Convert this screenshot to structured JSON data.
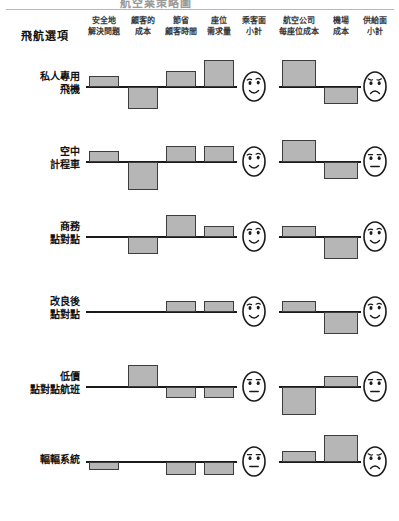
{
  "figure": {
    "clipped_title": "航空業策略圖",
    "row_header_label": "飛航選項"
  },
  "chart_data": {
    "type": "bar",
    "xlabel": "",
    "ylabel": "",
    "grid": false,
    "legend": "none",
    "note": "Six flight options rated on eight factors; positive bars point up, negative bars point down from each row baseline. Subtotal columns are rendered as face icons (happy / neutral / sad).",
    "categories": [
      "安全地解決問題",
      "顧客的成本",
      "節省顧客時間",
      "座位需求量",
      "乘客面小計",
      "航空公司每座位成本",
      "機場成本",
      "供給面小計"
    ],
    "category_headers": [
      {
        "line1": "安全地",
        "line2": "解決問題"
      },
      {
        "line1": "顧客的",
        "line2": "成本"
      },
      {
        "line1": "節省",
        "line2": "顧客時間"
      },
      {
        "line1": "座位",
        "line2": "需求量"
      },
      {
        "line1": "乘客面",
        "line2": "小計"
      },
      {
        "line1": "航空公司",
        "line2": "每座位成本"
      },
      {
        "line1": "機場",
        "line2": "成本"
      },
      {
        "line1": "供給面",
        "line2": "小計"
      }
    ],
    "subtotal_columns": [
      4,
      7
    ],
    "face_values": {
      "happy": "happy",
      "neutral": "neutral",
      "sad": "sad"
    },
    "series": [
      {
        "name": "私人專用飛機",
        "label_line1": "私人專用",
        "label_line2": "飛機",
        "values": [
          1,
          -2,
          1.5,
          2.5,
          null,
          2.5,
          -1.5,
          null
        ],
        "faces": {
          "passenger": "happy",
          "supply": "sad"
        }
      },
      {
        "name": "空中計程車",
        "label_line1": "空中",
        "label_line2": "計程車",
        "values": [
          1,
          -2.5,
          1.5,
          1.5,
          null,
          2,
          -1.5,
          null
        ],
        "faces": {
          "passenger": "happy",
          "supply": "neutral"
        }
      },
      {
        "name": "商務點對點",
        "label_line1": "商務",
        "label_line2": "點對點",
        "values": [
          0,
          -1.5,
          2,
          1,
          null,
          1,
          -2,
          null
        ],
        "faces": {
          "passenger": "happy",
          "supply": "happy"
        }
      },
      {
        "name": "改良後點對點",
        "label_line1": "改良後",
        "label_line2": "點對點",
        "values": [
          0,
          0,
          1,
          1,
          null,
          1,
          -2,
          null
        ],
        "faces": {
          "passenger": "happy",
          "supply": "happy"
        }
      },
      {
        "name": "低價點對點航班",
        "label_line1": "低價",
        "label_line2": "點對點航班",
        "values": [
          0,
          2,
          -1,
          -1,
          null,
          -2.5,
          1,
          null
        ],
        "faces": {
          "passenger": "neutral",
          "supply": "neutral"
        }
      },
      {
        "name": "輻輻系統",
        "label_line1": "輻輻系統",
        "label_line2": "",
        "values": [
          -0.7,
          0,
          -1.2,
          -1.2,
          null,
          1,
          2.5,
          null
        ],
        "faces": {
          "passenger": "neutral",
          "supply": "sad"
        }
      }
    ]
  },
  "colors": {
    "bar_fill": "#b6b6b6",
    "bar_stroke": "#3d3d3d",
    "baseline": "#1a1a1a",
    "text": "#111111",
    "rule": "#b8b8b8"
  }
}
